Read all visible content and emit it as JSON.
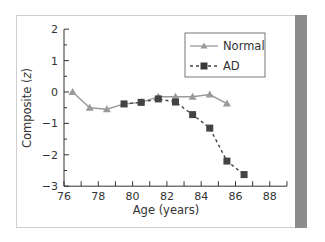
{
  "chart_data": {
    "type": "line",
    "title": "",
    "xlabel": "Age (years)",
    "ylabel": "Composite (z)",
    "xlim": [
      76,
      89
    ],
    "ylim": [
      -3,
      2
    ],
    "xticks": [
      76,
      78,
      80,
      82,
      84,
      86,
      88
    ],
    "xtick_labels": [
      "76",
      "78",
      "80",
      "82",
      "84",
      "86",
      "88"
    ],
    "yticks": [
      2,
      1,
      0,
      -1,
      -2,
      -3
    ],
    "ytick_labels": [
      "2",
      "1",
      "0",
      "−1",
      "−2",
      "−3"
    ],
    "grid": false,
    "legend_position": "upper right",
    "series": [
      {
        "name": "Normal",
        "marker": "triangle",
        "line_style": "solid",
        "color": "#9a9a9a",
        "x": [
          76.5,
          77.5,
          78.5,
          79.5,
          80.5,
          81.5,
          82.5,
          83.5,
          84.5,
          85.5
        ],
        "values": [
          0.0,
          -0.5,
          -0.55,
          -0.38,
          -0.33,
          -0.15,
          -0.15,
          -0.15,
          -0.08,
          -0.37
        ]
      },
      {
        "name": "AD",
        "marker": "square",
        "line_style": "dashed",
        "color": "#444444",
        "x": [
          79.5,
          80.5,
          81.5,
          82.5,
          83.5,
          84.5,
          85.5,
          86.5
        ],
        "values": [
          -0.38,
          -0.33,
          -0.22,
          -0.32,
          -0.72,
          -1.15,
          -2.2,
          -2.63
        ]
      }
    ]
  },
  "legend": {
    "normal_label": "Normal",
    "ad_label": "AD"
  },
  "axes": {
    "x_title": "Age (years)",
    "y_title_prefix": "Composite (",
    "y_title_var": "z",
    "y_title_suffix": ")"
  }
}
